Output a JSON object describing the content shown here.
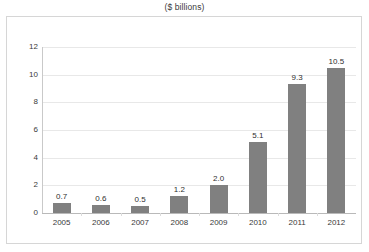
{
  "chart_data": {
    "type": "bar",
    "title": "($ billions)",
    "xlabel": "",
    "ylabel": "",
    "categories": [
      "2005",
      "2006",
      "2007",
      "2008",
      "2009",
      "2010",
      "2011",
      "2012"
    ],
    "values": [
      0.7,
      0.6,
      0.5,
      1.2,
      2.0,
      5.1,
      9.3,
      10.5
    ],
    "data_labels": [
      "0.7",
      "0.6",
      "0.5",
      "1.2",
      "2.0",
      "5.1",
      "9.3",
      "10.5"
    ],
    "ylim": [
      0,
      12
    ],
    "yticks": [
      0,
      2,
      4,
      6,
      8,
      10,
      12
    ],
    "ytick_labels": [
      "0",
      "2",
      "4",
      "6",
      "8",
      "10",
      "12"
    ],
    "grid": "horizontal",
    "legend": "none",
    "series": [
      {
        "name": "",
        "values": [
          0.7,
          0.6,
          0.5,
          1.2,
          2.0,
          5.1,
          9.3,
          10.5
        ]
      }
    ]
  },
  "colors": {
    "bar_fill": "#808080",
    "gridline": "#e8e8e8",
    "axis": "#b9b9b9",
    "frame_border": "#d6d6d6",
    "text": "#3a3a3a",
    "background": "#ffffff"
  }
}
